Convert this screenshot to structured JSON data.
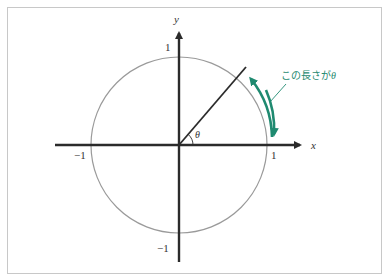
{
  "diagram": {
    "axes": {
      "x_label": "x",
      "y_label": "y",
      "ticks": {
        "x_pos": "1",
        "x_neg": "−1",
        "y_pos": "1",
        "y_neg": "−1"
      }
    },
    "angle_label": "θ",
    "annotation": {
      "text": "この長さが",
      "symbol": "θ"
    },
    "colors": {
      "axis": "#2b2b2b",
      "circle": "#9a9a9a",
      "ray": "#2b2b2b",
      "arc_arrow": "#1f8a70",
      "annotation": "#1f8a70",
      "frame": "#c8c8c8"
    },
    "geometry": {
      "origin": [
        179,
        145
      ],
      "radius": 88,
      "angle_deg": 48
    }
  }
}
